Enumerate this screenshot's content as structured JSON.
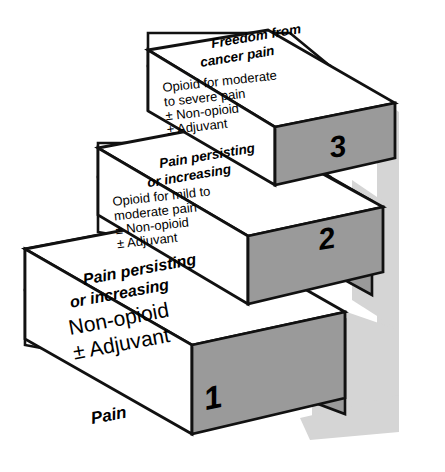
{
  "figure": {
    "base_label": "Pain",
    "colors": {
      "background": "#ffffff",
      "face_front": "#ffffff",
      "face_top": "#ffffff",
      "face_side": "#9a9a9a",
      "face_side_light": "#b9b9b9",
      "shadow": "#d5d5d5",
      "outline": "#111111",
      "text": "#000000"
    },
    "steps": [
      {
        "number": "1",
        "top_label_line1": "Pain persisting",
        "top_label_line2": "or increasing",
        "front_lines": [
          "Non-opioid",
          "± Adjuvant"
        ]
      },
      {
        "number": "2",
        "top_label_line1": "Pain persisting",
        "top_label_line2": "or increasing",
        "front_lines": [
          "Opioid for mild to",
          "moderate pain",
          "± Non-opioid",
          "± Adjuvant"
        ]
      },
      {
        "number": "3",
        "top_label_line1": "Freedom from",
        "top_label_line2": "cancer pain",
        "front_lines": [
          "Opioid for moderate",
          "to severe pain",
          "± Non-opioid",
          "± Adjuvant"
        ]
      }
    ]
  }
}
